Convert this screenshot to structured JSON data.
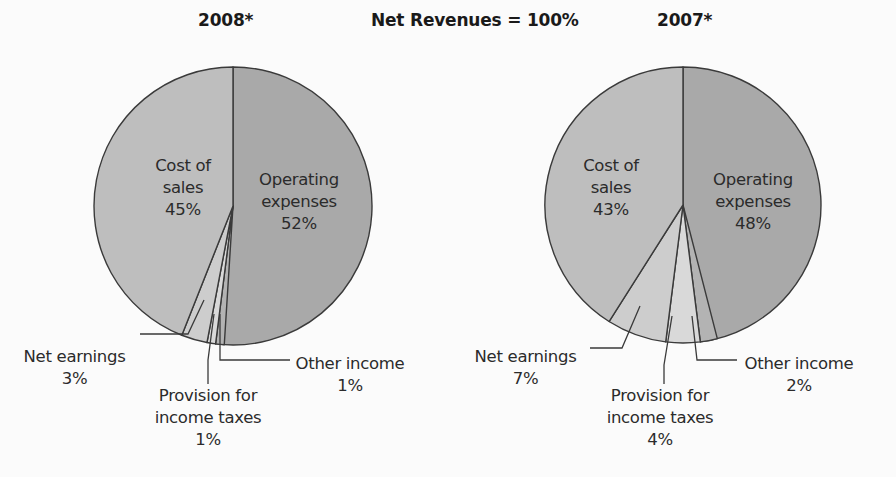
{
  "header": {
    "title_left": "2008*",
    "title_center": "Net Revenues = 100%",
    "title_right": "2007*"
  },
  "labels": {
    "cost_of_sales": "Cost of\nsales",
    "operating_expenses": "Operating\nexpenses",
    "net_earnings": "Net earnings",
    "provision": "Provision for\nincome taxes",
    "other_income": "Other income"
  },
  "pies": [
    {
      "year": "2008*",
      "cost_of_sales": "45%",
      "operating_expenses": "52%",
      "net_earnings": "3%",
      "provision": "1%",
      "other_income": "1%"
    },
    {
      "year": "2007*",
      "cost_of_sales": "43%",
      "operating_expenses": "48%",
      "net_earnings": "7%",
      "provision": "4%",
      "other_income": "2%"
    }
  ],
  "colors": {
    "operating_expenses": "#a9a9a9",
    "cost_of_sales": "#bebebe",
    "net_earnings": "#cdcdcd",
    "provision": "#d9d9d9",
    "other_income": "#b3b3b3",
    "outline": "#3a3a3a"
  },
  "chart_data": [
    {
      "type": "pie",
      "title": "2008*",
      "subtitle": "Net Revenues = 100%",
      "categories": [
        "Operating expenses",
        "Cost of sales",
        "Net earnings",
        "Provision for income taxes",
        "Other income"
      ],
      "values": [
        52,
        45,
        3,
        1,
        1
      ],
      "unit": "%"
    },
    {
      "type": "pie",
      "title": "2007*",
      "subtitle": "Net Revenues = 100%",
      "categories": [
        "Operating expenses",
        "Cost of sales",
        "Net earnings",
        "Provision for income taxes",
        "Other income"
      ],
      "values": [
        48,
        43,
        7,
        4,
        2
      ],
      "unit": "%"
    }
  ]
}
